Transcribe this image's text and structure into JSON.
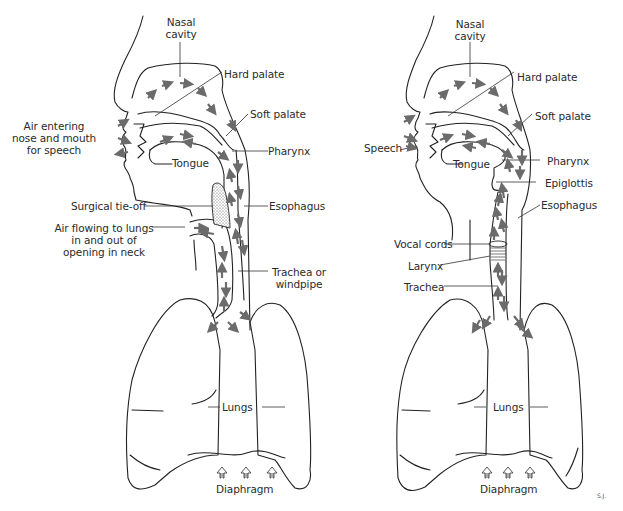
{
  "figure": {
    "colors": {
      "line": "#222222",
      "arrow": "#6b6b6b",
      "stipple": "#555555",
      "background": "#ffffff"
    },
    "artist_initials": "S.J."
  },
  "left_panel": {
    "name": "Airway after laryngectomy (surgical tie-off)",
    "labels": {
      "nasal_cavity_1": "Nasal",
      "nasal_cavity_2": "cavity",
      "hard_palate": "Hard palate",
      "soft_palate": "Soft palate",
      "air_entering_1": "Air entering",
      "air_entering_2": "nose and mouth",
      "air_entering_3": "for speech",
      "tongue": "Tongue",
      "pharynx": "Pharynx",
      "surgical_tie_off": "Surgical tie-off",
      "esophagus": "Esophagus",
      "air_flowing_1": "Air flowing to lungs",
      "air_flowing_2": "in and out of",
      "air_flowing_3": "opening in neck",
      "trachea_1": "Trachea or",
      "trachea_2": "windpipe",
      "lungs": "Lungs",
      "diaphragm": "Diaphragm"
    }
  },
  "right_panel": {
    "name": "Normal airway",
    "labels": {
      "nasal_cavity_1": "Nasal",
      "nasal_cavity_2": "cavity",
      "hard_palate": "Hard palate",
      "soft_palate": "Soft palate",
      "speech": "Speech",
      "tongue": "Tongue",
      "pharynx": "Pharynx",
      "epiglottis": "Epiglottis",
      "esophagus": "Esophagus",
      "vocal_cords": "Vocal cords",
      "larynx": "Larynx",
      "trachea": "Trachea",
      "lungs": "Lungs",
      "diaphragm": "Diaphragm"
    }
  }
}
